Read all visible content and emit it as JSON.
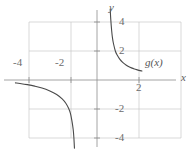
{
  "figure": {
    "background": "#ffffff",
    "grid_color": "#c8c8c8",
    "axis_color": "#8a8a8a",
    "curve_color": "#4a4a4a",
    "text_color": "#5a5a5a"
  },
  "labels": {
    "x_axis": "x",
    "y_axis": "y",
    "curve": "g(x)"
  },
  "chart_data": {
    "type": "line",
    "title": "",
    "xlabel": "x",
    "ylabel": "y",
    "xlim": [
      -4.6,
      2.65
    ],
    "ylim": [
      -4.7,
      4.9
    ],
    "grid": true,
    "legend_position": "inline-right",
    "x_ticks": [
      -4,
      -2
    ],
    "x_tick_labels": [
      "-4",
      "-2"
    ],
    "y_ticks": [
      4,
      2,
      -2,
      -4
    ],
    "y_tick_labels": [
      "4",
      "2",
      "-2",
      "-4"
    ],
    "extra_tick_labels": [
      {
        "text": "2",
        "axis": "x",
        "value": 2
      }
    ],
    "grid_x_lines": [
      -4,
      -2,
      0,
      2
    ],
    "grid_y_lines": [
      4,
      2,
      0,
      -2,
      -4
    ],
    "series": [
      {
        "name": "g(x)",
        "kind": "rational",
        "asymptote_vertical": 0.65,
        "asymptote_horizontal": 0.0,
        "description": "Hyperbola-like curve with vertical asymptote near x = 0.65 and horizontal asymptote y = 0; right branch falls from +infinity toward y = 0; left branch falls from y near 0 toward -infinity.",
        "branch_right_points": [
          [
            0.72,
            4.9
          ],
          [
            0.75,
            4.2
          ],
          [
            0.8,
            3.4
          ],
          [
            0.85,
            2.85
          ],
          [
            0.9,
            2.5
          ],
          [
            1.0,
            2.0
          ],
          [
            1.1,
            1.72
          ],
          [
            1.25,
            1.42
          ],
          [
            1.4,
            1.22
          ],
          [
            1.6,
            1.02
          ],
          [
            1.8,
            0.88
          ],
          [
            2.0,
            0.78
          ],
          [
            2.2,
            0.7
          ],
          [
            2.45,
            0.62
          ]
        ],
        "branch_left_points": [
          [
            -4.45,
            -0.2
          ],
          [
            -4.2,
            -0.24
          ],
          [
            -3.8,
            -0.32
          ],
          [
            -3.4,
            -0.42
          ],
          [
            -3.0,
            -0.55
          ],
          [
            -2.6,
            -0.74
          ],
          [
            -2.2,
            -1.0
          ],
          [
            -1.9,
            -1.3
          ],
          [
            -1.7,
            -1.6
          ],
          [
            -1.55,
            -1.95
          ],
          [
            -1.45,
            -2.3
          ],
          [
            -1.37,
            -2.8
          ],
          [
            -1.3,
            -3.4
          ],
          [
            -1.26,
            -4.0
          ],
          [
            -1.23,
            -4.7
          ]
        ]
      }
    ]
  },
  "positions": {
    "tick_minus4": {
      "left": 13,
      "top": 58
    },
    "tick_minus2": {
      "left": 55,
      "top": 58
    },
    "tick_4": {
      "left": 120,
      "top": 17
    },
    "tick_2": {
      "left": 120,
      "top": 46
    },
    "tick_neg2": {
      "left": 116,
      "top": 104
    },
    "tick_neg4": {
      "left": 116,
      "top": 132
    },
    "tick_x2": {
      "left": 137,
      "top": 82
    },
    "label_y": {
      "left": 110,
      "top": 3
    },
    "label_x": {
      "left": 180,
      "top": 73
    },
    "label_g": {
      "left": 146,
      "top": 58
    }
  }
}
